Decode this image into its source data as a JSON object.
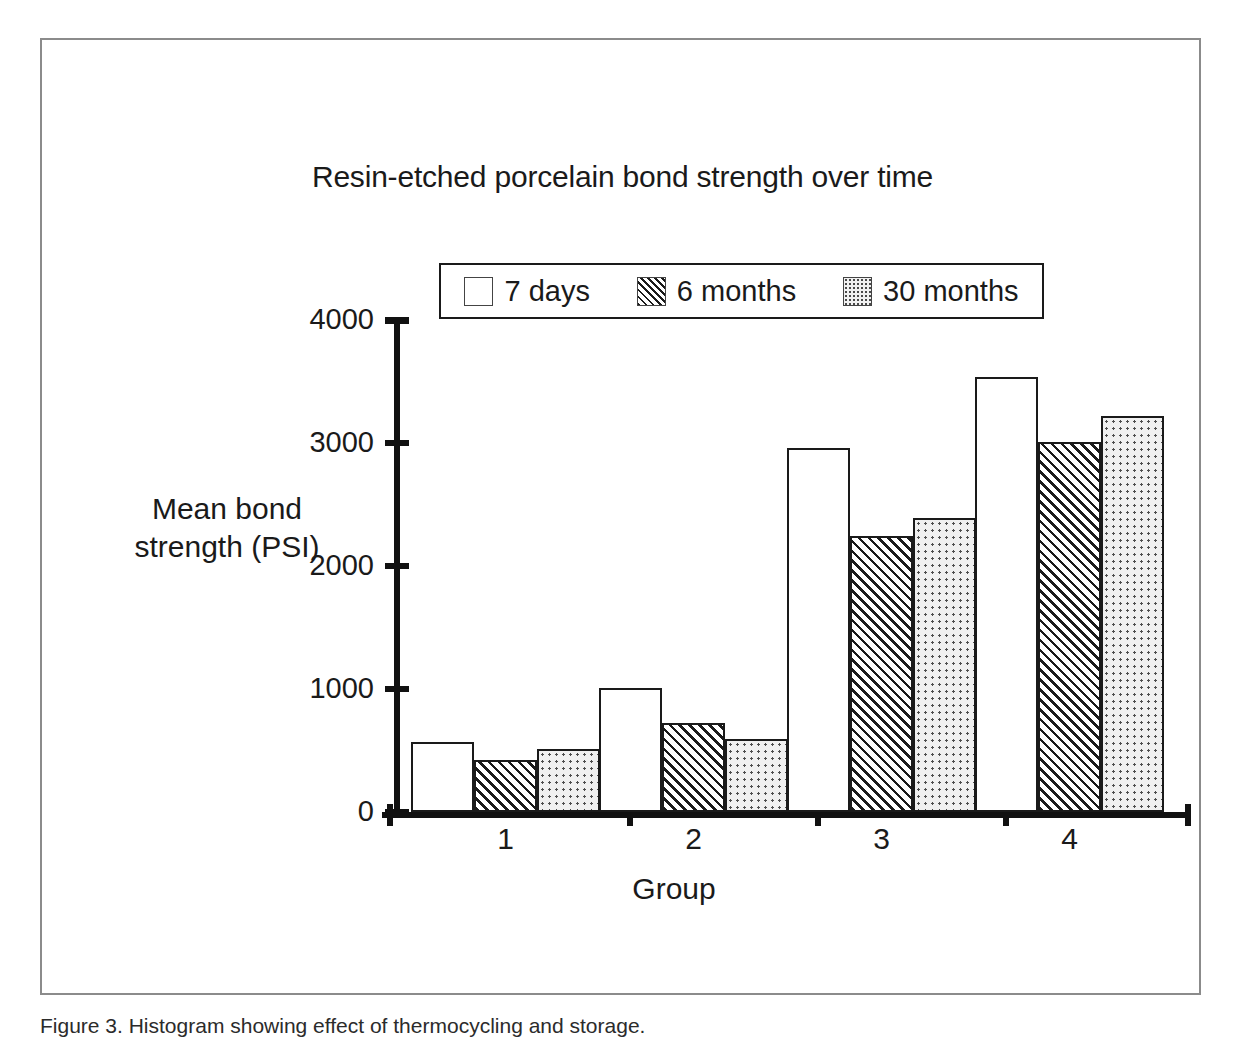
{
  "figure": {
    "caption": "Figure 3. Histogram showing effect of thermocycling and storage."
  },
  "chart_data": {
    "type": "bar",
    "title": "Resin-etched porcelain bond strength over time",
    "xlabel": "Group",
    "ylabel": "Mean bond\nstrength (PSI)",
    "ylabel_line1": "Mean bond",
    "ylabel_line2": "strength (PSI)",
    "categories": [
      "1",
      "2",
      "3",
      "4"
    ],
    "ylim": [
      0,
      4000
    ],
    "yticks": [
      0,
      1000,
      2000,
      3000,
      4000
    ],
    "ytick_labels": [
      "0",
      "1000",
      "2000",
      "3000",
      "4000"
    ],
    "grid": false,
    "legend_position": "top-center",
    "series": [
      {
        "name": "7 days",
        "pattern": "plain",
        "values": [
          570,
          1010,
          2960,
          3540
        ]
      },
      {
        "name": "6 months",
        "pattern": "diagonal-hatch",
        "values": [
          420,
          720,
          2240,
          3010
        ]
      },
      {
        "name": "30 months",
        "pattern": "dotted",
        "values": [
          510,
          590,
          2390,
          3220
        ]
      }
    ]
  },
  "axis": {
    "y_title_lines": [
      "Mean bond",
      "strength (PSI)"
    ],
    "x_title": "Group"
  }
}
